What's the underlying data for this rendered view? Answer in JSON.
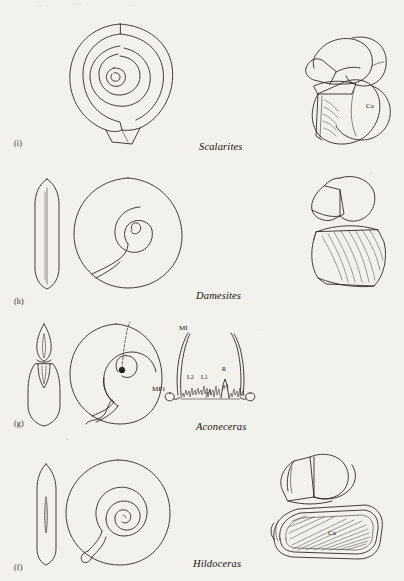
{
  "figure": {
    "background_color": "#f3f1ec",
    "ink_color": "#23201d",
    "rows": [
      {
        "id": "row-i",
        "label": "(i)",
        "genus": "Scalarites",
        "panels": [
          "heteromorph-coiled-shell",
          "jaw-apparatus"
        ],
        "annotations": [
          {
            "text": "Ca"
          }
        ]
      },
      {
        "id": "row-h",
        "label": "(h)",
        "genus": "Damesites",
        "panels": [
          "whorl-cross-section",
          "planispiral-shell",
          "bivalved-aptychus"
        ],
        "annotations": []
      },
      {
        "id": "row-g",
        "label": "(g)",
        "genus": "Aconeceras",
        "panels": [
          "whorl-cross-section",
          "planispiral-shell-with-suture",
          "suture-line-diagram"
        ],
        "annotations": [
          {
            "text": "MI"
          },
          {
            "text": "MP1"
          },
          {
            "text": "L2"
          },
          {
            "text": "L1"
          },
          {
            "text": "R"
          }
        ]
      },
      {
        "id": "row-f",
        "label": "(f)",
        "genus": "Hildoceras",
        "panels": [
          "whorl-cross-section",
          "evolute-planispiral-shell",
          "jaw-and-aptychus"
        ],
        "annotations": [
          {
            "text": "Ca"
          }
        ]
      }
    ]
  }
}
